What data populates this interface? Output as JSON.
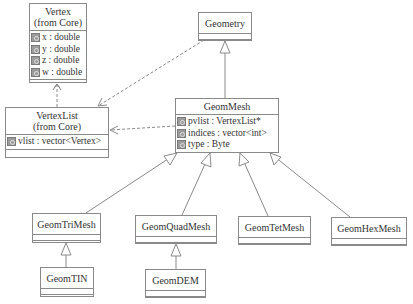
{
  "diagram": {
    "type": "uml-class-diagram",
    "classes": {
      "vertex": {
        "name": "Vertex",
        "stereotype": "(from Core)",
        "attributes": [
          "x : double",
          "y : double",
          "z : double",
          "w : double"
        ]
      },
      "vertexlist": {
        "name": "VertexList",
        "stereotype": "(from Core)",
        "attributes": [
          "vlist : vector<Vertex>"
        ]
      },
      "geometry": {
        "name": "Geometry",
        "attributes": []
      },
      "geommesh": {
        "name": "GeomMesh",
        "attributes": [
          "pvlist : VertexList*",
          "indices : vector<int>",
          "type : Byte"
        ]
      },
      "geomtrimesh": {
        "name": "GeomTriMesh",
        "attributes": []
      },
      "geomquadmesh": {
        "name": "GeomQuadMesh",
        "attributes": []
      },
      "geomtetmesh": {
        "name": "GeomTetMesh",
        "attributes": []
      },
      "geomhexmesh": {
        "name": "GeomHexMesh",
        "attributes": []
      },
      "geomtin": {
        "name": "GeomTIN",
        "attributes": []
      },
      "geomdem": {
        "name": "GeomDEM",
        "attributes": []
      }
    },
    "relations": [
      {
        "from": "GeomMesh",
        "to": "Geometry",
        "kind": "generalization"
      },
      {
        "from": "GeomTriMesh",
        "to": "GeomMesh",
        "kind": "generalization"
      },
      {
        "from": "GeomQuadMesh",
        "to": "GeomMesh",
        "kind": "generalization"
      },
      {
        "from": "GeomTetMesh",
        "to": "GeomMesh",
        "kind": "generalization"
      },
      {
        "from": "GeomHexMesh",
        "to": "GeomMesh",
        "kind": "generalization"
      },
      {
        "from": "GeomTIN",
        "to": "GeomTriMesh",
        "kind": "generalization"
      },
      {
        "from": "GeomDEM",
        "to": "GeomQuadMesh",
        "kind": "generalization"
      },
      {
        "from": "VertexList",
        "to": "Vertex",
        "kind": "dependency"
      },
      {
        "from": "Geometry",
        "to": "VertexList",
        "kind": "dependency"
      },
      {
        "from": "GeomMesh",
        "to": "VertexList",
        "kind": "dependency"
      }
    ],
    "colors": {
      "line": "#8a8a8a",
      "icon": "#9c9c9c",
      "text": "#333333"
    }
  }
}
